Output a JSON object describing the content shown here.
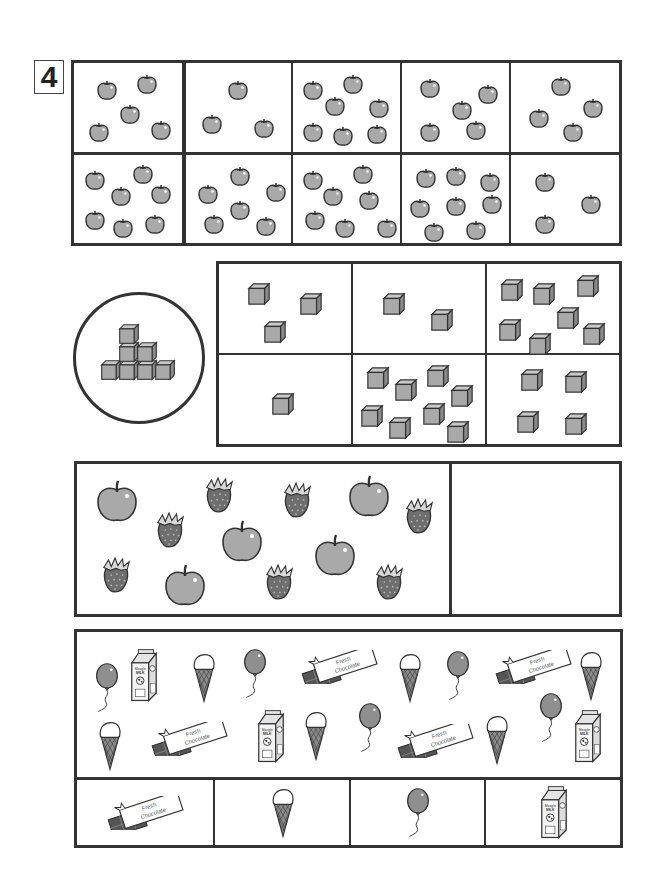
{
  "worksheet": {
    "problem_number": "4",
    "section_apples": {
      "title": "apple-count-grid",
      "rows": [
        [
          {
            "count": 5,
            "items": [
              [
                22,
                16
              ],
              [
                62,
                10
              ],
              [
                45,
                40
              ],
              [
                14,
                58
              ],
              [
                76,
                56
              ]
            ]
          },
          {
            "count": 3,
            "items": [
              [
                44,
                16
              ],
              [
                18,
                50
              ],
              [
                70,
                54
              ]
            ]
          },
          {
            "count": 7,
            "items": [
              [
                10,
                16
              ],
              [
                50,
                10
              ],
              [
                32,
                32
              ],
              [
                76,
                34
              ],
              [
                10,
                58
              ],
              [
                40,
                62
              ],
              [
                74,
                60
              ]
            ]
          },
          {
            "count": 5,
            "items": [
              [
                18,
                14
              ],
              [
                76,
                20
              ],
              [
                50,
                36
              ],
              [
                18,
                58
              ],
              [
                64,
                56
              ]
            ]
          },
          {
            "count": 4,
            "items": [
              [
                40,
                12
              ],
              [
                72,
                34
              ],
              [
                18,
                44
              ],
              [
                52,
                58
              ]
            ]
          }
        ],
        [
          {
            "count": 7,
            "items": [
              [
                10,
                16
              ],
              [
                58,
                10
              ],
              [
                36,
                32
              ],
              [
                76,
                30
              ],
              [
                10,
                56
              ],
              [
                38,
                64
              ],
              [
                70,
                60
              ]
            ]
          },
          {
            "count": 6,
            "items": [
              [
                46,
                12
              ],
              [
                14,
                30
              ],
              [
                82,
                28
              ],
              [
                46,
                46
              ],
              [
                20,
                60
              ],
              [
                72,
                62
              ]
            ]
          },
          {
            "count": 7,
            "items": [
              [
                10,
                16
              ],
              [
                60,
                10
              ],
              [
                30,
                32
              ],
              [
                66,
                36
              ],
              [
                12,
                56
              ],
              [
                42,
                64
              ],
              [
                84,
                64
              ]
            ]
          },
          {
            "count": 8,
            "items": [
              [
                14,
                14
              ],
              [
                44,
                12
              ],
              [
                78,
                18
              ],
              [
                8,
                44
              ],
              [
                44,
                42
              ],
              [
                80,
                40
              ],
              [
                22,
                68
              ],
              [
                64,
                66
              ]
            ]
          },
          {
            "count": 3,
            "items": [
              [
                24,
                18
              ],
              [
                70,
                40
              ],
              [
                24,
                60
              ]
            ]
          }
        ]
      ]
    },
    "section_cubes": {
      "reference_count": 7,
      "reference_label": "cube-tower",
      "rows": [
        [
          {
            "count": 3,
            "items": [
              [
                28,
                18
              ],
              [
                80,
                28
              ],
              [
                44,
                56
              ]
            ]
          },
          {
            "count": 2,
            "items": [
              [
                30,
                28
              ],
              [
                78,
                44
              ]
            ]
          },
          {
            "count": 7,
            "items": [
              [
                14,
                14
              ],
              [
                46,
                18
              ],
              [
                90,
                10
              ],
              [
                12,
                54
              ],
              [
                42,
                68
              ],
              [
                70,
                42
              ],
              [
                96,
                58
              ]
            ]
          }
        ],
        [
          {
            "count": 1,
            "items": [
              [
                52,
                38
              ]
            ]
          },
          {
            "count": 8,
            "items": [
              [
                14,
                12
              ],
              [
                42,
                24
              ],
              [
                74,
                10
              ],
              [
                98,
                30
              ],
              [
                8,
                50
              ],
              [
                36,
                62
              ],
              [
                70,
                48
              ],
              [
                94,
                66
              ]
            ]
          },
          {
            "count": 4,
            "items": [
              [
                34,
                14
              ],
              [
                78,
                16
              ],
              [
                30,
                56
              ],
              [
                78,
                58
              ]
            ]
          }
        ]
      ]
    },
    "section_fruits": {
      "apples_count": 5,
      "strawberries_count": 7,
      "items": [
        {
          "type": "apple",
          "x": 95,
          "y": 480
        },
        {
          "type": "apple",
          "x": 347,
          "y": 475
        },
        {
          "type": "apple",
          "x": 220,
          "y": 520
        },
        {
          "type": "apple",
          "x": 313,
          "y": 534
        },
        {
          "type": "apple",
          "x": 163,
          "y": 564
        },
        {
          "type": "strawberry",
          "x": 203,
          "y": 475
        },
        {
          "type": "strawberry",
          "x": 281,
          "y": 480
        },
        {
          "type": "strawberry",
          "x": 403,
          "y": 496
        },
        {
          "type": "strawberry",
          "x": 154,
          "y": 510
        },
        {
          "type": "strawberry",
          "x": 100,
          "y": 555
        },
        {
          "type": "strawberry",
          "x": 263,
          "y": 562
        },
        {
          "type": "strawberry",
          "x": 373,
          "y": 562
        }
      ],
      "answer_box": ""
    },
    "section_treats": {
      "items": [
        {
          "type": "balloon",
          "x": 94,
          "y": 660
        },
        {
          "type": "milk",
          "x": 128,
          "y": 648
        },
        {
          "type": "icecream",
          "x": 191,
          "y": 650
        },
        {
          "type": "balloon",
          "x": 242,
          "y": 646
        },
        {
          "type": "chocolate",
          "x": 300,
          "y": 650
        },
        {
          "type": "icecream",
          "x": 397,
          "y": 650
        },
        {
          "type": "balloon",
          "x": 445,
          "y": 648
        },
        {
          "type": "chocolate",
          "x": 494,
          "y": 650
        },
        {
          "type": "icecream",
          "x": 578,
          "y": 648
        },
        {
          "type": "icecream",
          "x": 97,
          "y": 718
        },
        {
          "type": "chocolate",
          "x": 150,
          "y": 722
        },
        {
          "type": "milk",
          "x": 255,
          "y": 709
        },
        {
          "type": "icecream",
          "x": 303,
          "y": 708
        },
        {
          "type": "balloon",
          "x": 357,
          "y": 700
        },
        {
          "type": "chocolate",
          "x": 396,
          "y": 724
        },
        {
          "type": "icecream",
          "x": 484,
          "y": 712
        },
        {
          "type": "balloon",
          "x": 538,
          "y": 690
        },
        {
          "type": "milk",
          "x": 572,
          "y": 709
        }
      ],
      "answer_row": [
        {
          "type": "chocolate",
          "label": "chocolate"
        },
        {
          "type": "icecream",
          "label": "ice cream"
        },
        {
          "type": "balloon",
          "label": "balloon"
        },
        {
          "type": "milk",
          "label": "milk"
        }
      ],
      "chocolate_label_line1": "Fresh",
      "chocolate_label_line2": "Chocolate",
      "milk_label_line1": "Moogle",
      "milk_label_line2": "MILK"
    },
    "colors": {
      "stroke": "#333333",
      "gray_fill": "#a9a9a9",
      "dark_fill": "#6e6e6e",
      "light_fill": "#c8c8c8"
    }
  }
}
